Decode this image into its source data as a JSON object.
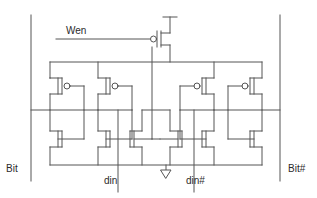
{
  "figure": {
    "kind": "circuit-schematic",
    "stroke_color": "#555555",
    "text_color": "#2b2b2b",
    "background_color": "#ffffff",
    "line_width": 1
  },
  "labels": {
    "wen": "Wen",
    "bit": "Bit",
    "bit_hash": "Bit#",
    "din": "din",
    "din_hash": "din#"
  },
  "nets": {
    "vdd_rail": "VDD",
    "gnd_rail": "GND"
  },
  "symbols": {
    "ground": "ground-triangle",
    "pmos_bubble": "pmos-gate-bubble",
    "nmos": "nmos-gate-plain"
  },
  "devices": {
    "pmos_count": 5,
    "nmos_count": 6,
    "wen_pmos": "write-enable-pmos",
    "left_inverter_pmos": "left-inv-pmos",
    "left_feedback_pmos": "left-fb-pmos",
    "right_feedback_pmos": "right-fb-pmos",
    "right_inverter_pmos": "right-inv-pmos"
  }
}
